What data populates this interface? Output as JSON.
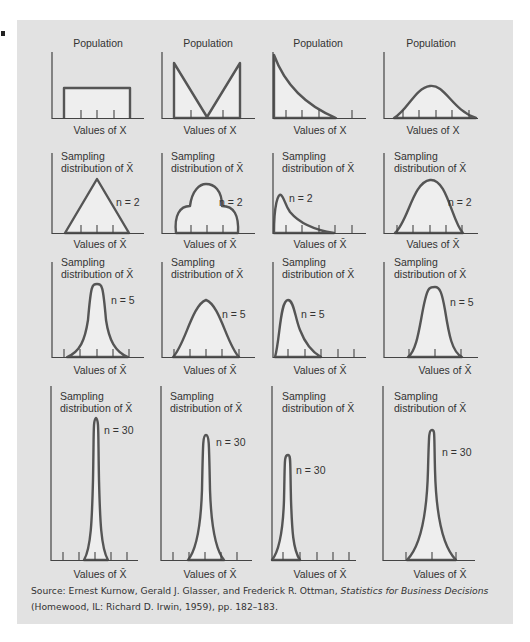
{
  "figure": {
    "colors": {
      "panel_background": "#e2e2e2",
      "area_fill": "#eeeeee",
      "curve_stroke": "#555555",
      "axis_stroke": "#444444",
      "text": "#333333"
    },
    "column_count": 4,
    "rows": [
      {
        "id": "population",
        "title": "Population",
        "x_label": "Values of X",
        "n_label": null
      },
      {
        "id": "n2",
        "title_line1": "Sampling",
        "title_line2": "distribution of X̄",
        "x_label": "Values of X̄",
        "n_label": "n = 2"
      },
      {
        "id": "n5",
        "title_line1": "Sampling",
        "title_line2": "distribution of X̄",
        "x_label": "Values of X̄",
        "n_label": "n = 5"
      },
      {
        "id": "n30",
        "title_line1": "Sampling",
        "title_line2": "distribution of X̄",
        "x_label": "Values of X̄",
        "n_label": "n = 30"
      }
    ],
    "columns": [
      {
        "population_shape": "uniform"
      },
      {
        "population_shape": "V-shaped (bimodal)"
      },
      {
        "population_shape": "exponential (right-skewed)"
      },
      {
        "population_shape": "normal"
      }
    ]
  },
  "source": {
    "prefix": "Source: Ernest Kurnow, Gerald J. Glasser, and Frederick R. Ottman, ",
    "title": "Statistics for Business Decisions",
    "suffix": " (Homewood, IL: Richard D. Irwin, 1959), pp. 182–183."
  }
}
